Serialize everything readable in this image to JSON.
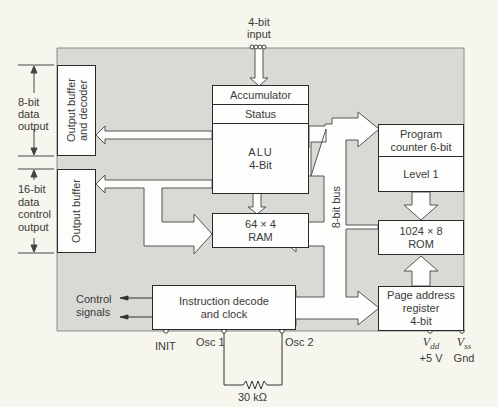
{
  "diagram": {
    "colors": {
      "background": "#f7f6ee",
      "chip": "#d9d9d6",
      "box_fill": "#fdfdfb",
      "stroke": "#2a2a2a",
      "bus": "#fdfdfb"
    },
    "input": {
      "line1": "4-bit",
      "line2": "input"
    },
    "blocks": {
      "accumulator": "Accumulator",
      "status": "Status",
      "alu_line1": "ALU",
      "alu_line2": "4-Bit",
      "ram_line1": "64 × 4",
      "ram_line2": "RAM",
      "pc_line1": "Program",
      "pc_line2": "counter 6-bit",
      "level": "Level 1",
      "rom_line1": "1024 × 8",
      "rom_line2": "ROM",
      "par_line1": "Page address",
      "par_line2": "register",
      "par_line3": "4-bit",
      "idc_line1": "Instruction decode",
      "idc_line2": "and clock",
      "obd_line1": "Output buffer",
      "obd_line2": "and decoder",
      "ob": "Output buffer"
    },
    "bus_label": "8-bit bus",
    "left_labels": {
      "data8_line1": "8-bit",
      "data8_line2": "data",
      "data8_line3": "output",
      "ctrl16_line1": "16-bit",
      "ctrl16_line2": "data",
      "ctrl16_line3": "control",
      "ctrl16_line4": "output",
      "control_line1": "Control",
      "control_line2": "signals"
    },
    "pins": {
      "init": "INIT",
      "osc1": "Osc 1",
      "osc2": "Osc 2",
      "resistor": "30 kΩ",
      "vdd_sym": "V",
      "vdd_sub": "dd",
      "vdd_val": "+5 V",
      "vss_sym": "V",
      "vss_sub": "ss",
      "vss_val": "Gnd"
    }
  }
}
